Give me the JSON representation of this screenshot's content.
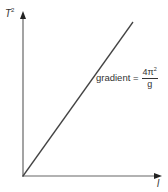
{
  "diagram": {
    "y_axis_label": "T",
    "y_axis_label_power": "2",
    "x_axis_label": "l",
    "annotation": {
      "prefix": "gradient =",
      "numerator": "4π",
      "numerator_power": "2",
      "denominator": "g"
    },
    "line": {
      "from": [
        23,
        176
      ],
      "to": [
        133,
        22
      ]
    },
    "colors": {
      "axis": "#555555",
      "line": "#444444",
      "text": "#333333"
    }
  }
}
